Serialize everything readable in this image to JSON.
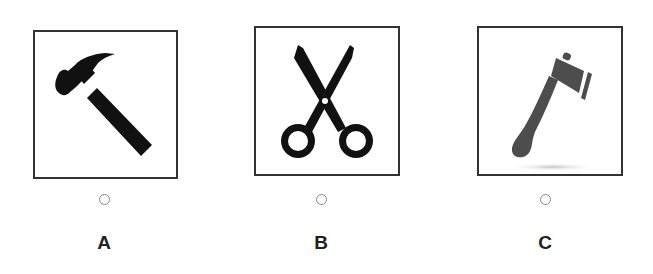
{
  "question": {
    "options": [
      {
        "id": "A",
        "label": "A",
        "icon": "hammer-icon",
        "selected": false,
        "icon_color": "#111111"
      },
      {
        "id": "B",
        "label": "B",
        "icon": "scissors-icon",
        "selected": false,
        "icon_color": "#111111"
      },
      {
        "id": "C",
        "label": "C",
        "icon": "axe-icon",
        "selected": false,
        "icon_color": "#4d4d4d"
      }
    ]
  },
  "colors": {
    "card_border": "#333333",
    "radio_border": "#888888",
    "label_text": "#222222"
  }
}
